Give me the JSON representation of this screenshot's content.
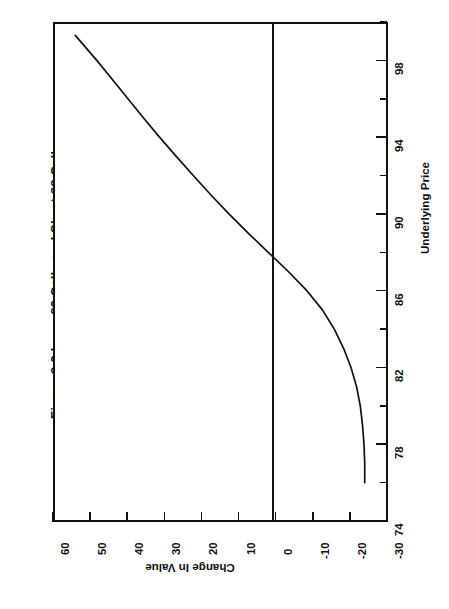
{
  "figure": {
    "title": "Figure 8-9  Long 86 Calls and Short 88 Calls",
    "orientation": "rotated-90-ccw"
  },
  "axes": {
    "price": {
      "title": "Underlying Price",
      "ticks": [
        "74",
        "78",
        "82",
        "86",
        "90",
        "94",
        "98"
      ]
    },
    "value": {
      "title": "Change In Value",
      "ticks": [
        "60",
        "50",
        "40",
        "30",
        "20",
        "10",
        "0",
        "-10",
        "-20",
        "-30"
      ]
    }
  },
  "chart_data": {
    "type": "line",
    "title": "Figure 8-9  Long 86 Calls and Short 88 Calls",
    "xlabel": "Underlying Price",
    "ylabel": "Change In Value",
    "xlim": [
      74,
      100
    ],
    "ylim": [
      -30,
      60
    ],
    "xticks": [
      74,
      78,
      82,
      86,
      90,
      94,
      98
    ],
    "yticks": [
      -30,
      -20,
      -10,
      0,
      10,
      20,
      30,
      40,
      50,
      60
    ],
    "xtick_labels": [
      "74",
      "78",
      "82",
      "86",
      "90",
      "94",
      "98"
    ],
    "ytick_labels": [
      "-30",
      "-20",
      "-10",
      "0",
      "10",
      "20",
      "30",
      "40",
      "50",
      "60"
    ],
    "grid": false,
    "legend": null,
    "annotations": [
      {
        "text": "zero reference line",
        "y": 0
      }
    ],
    "series": [
      {
        "name": "Change In Value",
        "x": [
          76.0,
          77.0,
          78.0,
          79.0,
          80.0,
          81.0,
          82.0,
          83.0,
          84.0,
          85.0,
          86.0,
          87.0,
          88.0,
          89.0,
          90.0,
          91.0,
          92.0,
          93.0,
          94.0,
          95.0,
          96.0,
          97.0,
          98.0,
          99.3
        ],
        "y": [
          -24.0,
          -24.0,
          -23.8,
          -23.4,
          -22.8,
          -21.8,
          -20.3,
          -18.3,
          -15.8,
          -12.6,
          -8.4,
          -3.4,
          2.0,
          7.4,
          12.6,
          17.5,
          22.2,
          26.8,
          31.3,
          35.6,
          39.8,
          44.0,
          48.2,
          54.0
        ]
      }
    ]
  }
}
